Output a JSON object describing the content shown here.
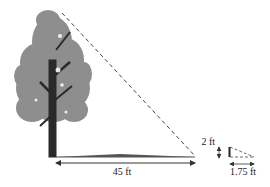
{
  "figure": {
    "type": "similar-triangles shadow diagram",
    "labels": {
      "tree_shadow": "45 ft",
      "stick_height": "2 ft",
      "stick_shadow": "1.75 ft"
    },
    "colors": {
      "foliage": "#8e8e8e",
      "trunk": "#2a2a2a",
      "lines": "#333333",
      "shadow": "#555555"
    }
  }
}
